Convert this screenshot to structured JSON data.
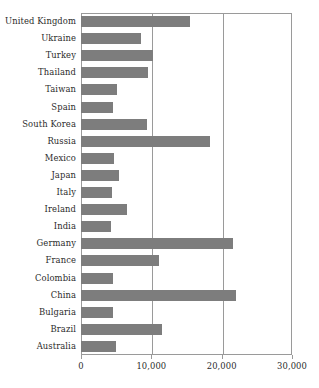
{
  "chart_data": {
    "type": "bar",
    "orientation": "horizontal",
    "title": "",
    "xlabel": "",
    "ylabel": "",
    "xlim": [
      0,
      30000
    ],
    "xticks": [
      0,
      10000,
      20000,
      30000
    ],
    "xticklabels": [
      "0",
      "10,000",
      "20,000",
      "30,000"
    ],
    "grid": true,
    "grid_axis": "x",
    "legend": false,
    "bar_color": "#7d7d7d",
    "axis_color": "#9a9a9a",
    "text_color": "#2b2b2b",
    "categories": [
      "United Kingdom",
      "Ukraine",
      "Turkey",
      "Thailand",
      "Taiwan",
      "Spain",
      "South Korea",
      "Russia",
      "Mexico",
      "Japan",
      "Italy",
      "Ireland",
      "India",
      "Germany",
      "France",
      "Colombia",
      "China",
      "Bulgaria",
      "Brazil",
      "Australia"
    ],
    "values": [
      15500,
      8500,
      10300,
      9500,
      5100,
      4500,
      9350,
      18350,
      4750,
      5450,
      4450,
      6500,
      4250,
      21600,
      11150,
      4500,
      22100,
      4500,
      11550,
      4950
    ]
  }
}
